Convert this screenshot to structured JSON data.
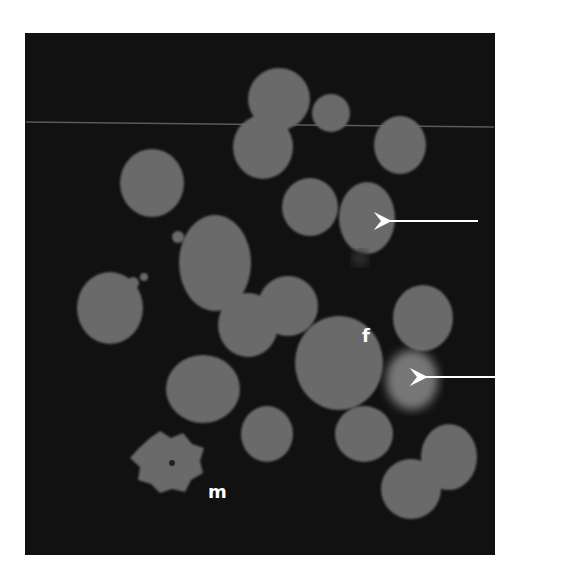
{
  "figure": {
    "type": "fluorescence micrograph",
    "background_color": "#111111",
    "cell_color": "#6a6a6a",
    "labels": [
      {
        "text": "f",
        "x": 368,
        "y": 340
      },
      {
        "text": "m",
        "x": 218,
        "y": 492
      }
    ],
    "arrows": [
      {
        "x1": 478,
        "y1": 221,
        "x2": 380,
        "y2": 221
      },
      {
        "x1": 513,
        "y1": 377,
        "x2": 416,
        "y2": 377
      }
    ]
  }
}
